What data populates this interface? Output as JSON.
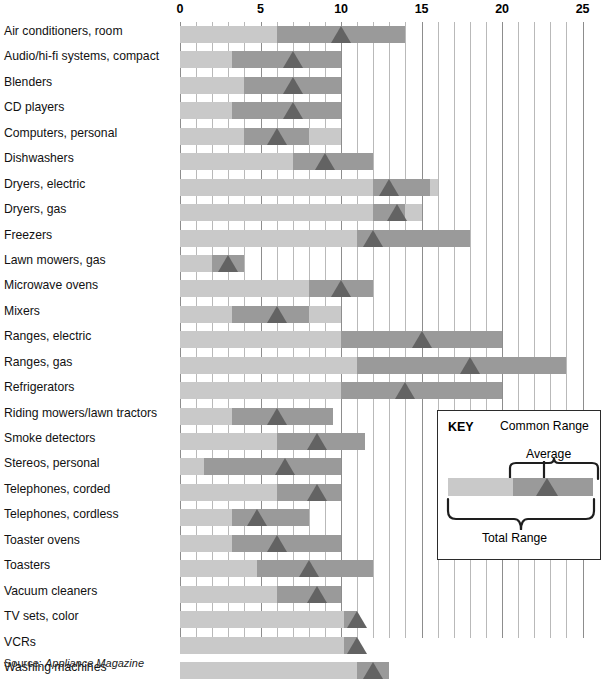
{
  "source": {
    "prefix": "Source:",
    "name": "Appliance Magazine"
  },
  "axis": {
    "ticks": [
      0,
      5,
      10,
      15,
      20,
      25
    ],
    "labels": [
      "0",
      "5",
      "10",
      "15",
      "20",
      "25"
    ],
    "min": 0,
    "max": 25
  },
  "legend": {
    "key_label": "KEY",
    "common_range_label": "Common Range",
    "average_label": "Average",
    "total_range_label": "Total Range"
  },
  "colors": {
    "total_range": "#c9c9c9",
    "common_range": "#9a9a9a",
    "average": "#636363",
    "gridline": "#b9b9b9",
    "gridline_major": "#8d8d8d"
  },
  "chart_data": {
    "type": "bar",
    "title": "",
    "xlabel": "",
    "ylabel": "",
    "xlim": [
      0,
      25
    ],
    "grid": true,
    "legend_position": "inside-bottom-right",
    "series": [
      {
        "name": "Total Range",
        "kind": "range"
      },
      {
        "name": "Common Range",
        "kind": "range"
      },
      {
        "name": "Average",
        "kind": "marker"
      }
    ],
    "categories": [
      "Air conditioners, room",
      "Audio/hi-fi systems, compact",
      "Blenders",
      "CD players",
      "Computers, personal",
      "Dishwashers",
      "Dryers, electric",
      "Dryers, gas",
      "Freezers",
      "Lawn mowers, gas",
      "Microwave ovens",
      "Mixers",
      "Ranges, electric",
      "Ranges, gas",
      "Refrigerators",
      "Riding mowers/lawn tractors",
      "Smoke detectors",
      "Stereos, personal",
      "Telephones, corded",
      "Telephones, cordless",
      "Toaster ovens",
      "Toasters",
      "Vacuum cleaners",
      "TV sets, color",
      "VCRs",
      "Washing machines"
    ],
    "rows": [
      {
        "category": "Air conditioners, room",
        "total": [
          0,
          14
        ],
        "common": [
          6,
          14
        ],
        "average": 10
      },
      {
        "category": "Audio/hi-fi systems, compact",
        "total": [
          0,
          10
        ],
        "common": [
          3.2,
          10
        ],
        "average": 7
      },
      {
        "category": "Blenders",
        "total": [
          0,
          10
        ],
        "common": [
          4,
          10
        ],
        "average": 7
      },
      {
        "category": "CD players",
        "total": [
          0,
          10
        ],
        "common": [
          3.2,
          10
        ],
        "average": 7
      },
      {
        "category": "Computers, personal",
        "total": [
          0,
          10
        ],
        "common": [
          4,
          8
        ],
        "average": 6
      },
      {
        "category": "Dishwashers",
        "total": [
          0,
          12
        ],
        "common": [
          7,
          12
        ],
        "average": 9
      },
      {
        "category": "Dryers, electric",
        "total": [
          0,
          16
        ],
        "common": [
          12,
          15.5
        ],
        "average": 13
      },
      {
        "category": "Dryers, gas",
        "total": [
          0,
          15
        ],
        "common": [
          12,
          14
        ],
        "average": 13.5
      },
      {
        "category": "Freezers",
        "total": [
          0,
          18
        ],
        "common": [
          11,
          18
        ],
        "average": 12
      },
      {
        "category": "Lawn mowers, gas",
        "total": [
          0,
          4
        ],
        "common": [
          2,
          4
        ],
        "average": 3
      },
      {
        "category": "Microwave ovens",
        "total": [
          0,
          12
        ],
        "common": [
          8,
          12
        ],
        "average": 10
      },
      {
        "category": "Mixers",
        "total": [
          0,
          10
        ],
        "common": [
          3.2,
          8
        ],
        "average": 6
      },
      {
        "category": "Ranges, electric",
        "total": [
          0,
          20
        ],
        "common": [
          10,
          20
        ],
        "average": 15
      },
      {
        "category": "Ranges, gas",
        "total": [
          0,
          24
        ],
        "common": [
          11,
          24
        ],
        "average": 18
      },
      {
        "category": "Refrigerators",
        "total": [
          0,
          20
        ],
        "common": [
          10,
          20
        ],
        "average": 14
      },
      {
        "category": "Riding mowers/lawn tractors",
        "total": [
          0,
          9.5
        ],
        "common": [
          3.2,
          9.5
        ],
        "average": 6
      },
      {
        "category": "Smoke detectors",
        "total": [
          0,
          11.5
        ],
        "common": [
          6,
          11.5
        ],
        "average": 8.5
      },
      {
        "category": "Stereos, personal",
        "total": [
          0,
          10
        ],
        "common": [
          1.5,
          10
        ],
        "average": 6.5
      },
      {
        "category": "Telephones, corded",
        "total": [
          0,
          10
        ],
        "common": [
          6,
          10
        ],
        "average": 8.5
      },
      {
        "category": "Telephones, cordless",
        "total": [
          0,
          8
        ],
        "common": [
          3.2,
          8
        ],
        "average": 4.8
      },
      {
        "category": "Toaster ovens",
        "total": [
          0,
          10
        ],
        "common": [
          3.2,
          10
        ],
        "average": 6
      },
      {
        "category": "Toasters",
        "total": [
          0,
          12
        ],
        "common": [
          4.8,
          12
        ],
        "average": 8
      },
      {
        "category": "Vacuum cleaners",
        "total": [
          0,
          10
        ],
        "common": [
          6,
          10
        ],
        "average": 8.5
      },
      {
        "category": "TV sets, color",
        "total": [
          0,
          11
        ],
        "common": [
          10.2,
          11
        ],
        "average": 11
      },
      {
        "category": "VCRs",
        "total": [
          0,
          11
        ],
        "common": [
          10.2,
          11
        ],
        "average": 11
      },
      {
        "category": "Washing machines",
        "total": [
          0,
          13
        ],
        "common": [
          11,
          13
        ],
        "average": 12
      }
    ]
  }
}
